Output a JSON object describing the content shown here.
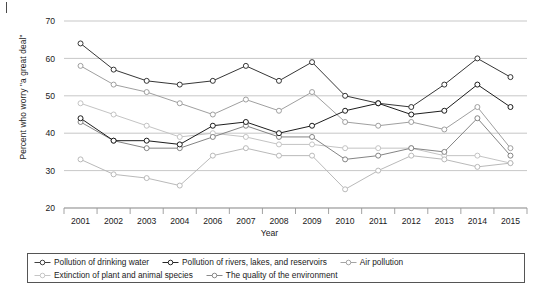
{
  "figure": {
    "background": "#ffffff",
    "corner_mark": "page-artifact-tick"
  },
  "axes": {
    "y_axis_label": "Percent who worry \"a great deal\"",
    "x_axis_label": "Year",
    "y_ticks": [
      20,
      30,
      40,
      50,
      60,
      70
    ],
    "y_min": 20,
    "y_max": 70,
    "grid": "horizontal"
  },
  "legend": {
    "position": "below-plot",
    "border_color": "#555555",
    "rows": [
      [
        {
          "label": "Pollution of drinking water",
          "color": "#2b2b2b"
        },
        {
          "label": "Pollution of rivers, lakes, and reservoirs",
          "color": "#111111"
        },
        {
          "label": "Air pollution",
          "color": "#9a9a9a"
        }
      ],
      [
        {
          "label": "Extinction of plant and animal species",
          "color": "#c0c0c0"
        },
        {
          "label": "The quality of the environment",
          "color": "#7d7d7d"
        }
      ]
    ]
  },
  "chart_data": {
    "type": "line",
    "title": "",
    "xlabel": "Year",
    "ylabel": "Percent who worry \"a great deal\"",
    "ylim": [
      20,
      70
    ],
    "yticks": [
      20,
      30,
      40,
      50,
      60,
      70
    ],
    "grid": true,
    "legend_position": "below",
    "marker": "open-circle",
    "categories": [
      "2001",
      "2002",
      "2003",
      "2004",
      "2006",
      "2007",
      "2008",
      "2009",
      "2010",
      "2011",
      "2012",
      "2013",
      "2014",
      "2015"
    ],
    "series": [
      {
        "name": "Pollution of drinking water",
        "color": "#2b2b2b",
        "values": [
          64,
          57,
          54,
          53,
          54,
          58,
          54,
          59,
          50,
          48,
          47,
          53,
          60,
          55
        ]
      },
      {
        "name": "Pollution of rivers, lakes, and reservoirs",
        "color": "#111111",
        "values": [
          44,
          38,
          38,
          37,
          42,
          43,
          40,
          42,
          46,
          48,
          45,
          46,
          53,
          47
        ]
      },
      {
        "name": "Air pollution",
        "color": "#9a9a9a",
        "values": [
          58,
          53,
          51,
          48,
          45,
          49,
          46,
          51,
          43,
          42,
          43,
          41,
          47,
          36
        ]
      },
      {
        "name": "Extinction of plant and animal species",
        "color": "#c0c0c0",
        "values": [
          48,
          45,
          42,
          39,
          40,
          39,
          37,
          37,
          36,
          36,
          36,
          34,
          34,
          32
        ]
      },
      {
        "name": "The quality of the environment",
        "color": "#7d7d7d",
        "values": [
          43,
          38,
          36,
          36,
          39,
          42,
          39,
          39,
          33,
          34,
          36,
          35,
          44,
          34
        ]
      },
      {
        "name": "Climate change trace",
        "color": "#b5b5b5",
        "values": [
          33,
          29,
          28,
          26,
          34,
          36,
          34,
          34,
          25,
          30,
          34,
          33,
          31,
          32
        ]
      }
    ]
  }
}
